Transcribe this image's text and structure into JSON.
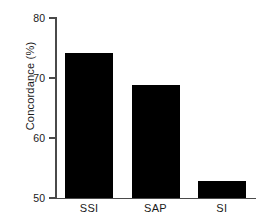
{
  "chart_data": {
    "type": "bar",
    "title": "",
    "xlabel": "",
    "ylabel": "Concordance (%)",
    "categories": [
      "SSI",
      "SAP",
      "SI"
    ],
    "values": [
      74.1,
      68.8,
      52.8
    ],
    "ylim": [
      50,
      80
    ],
    "yticks": [
      50,
      60,
      70,
      80
    ],
    "ytick_labels": [
      "50",
      "60",
      "70",
      "80"
    ],
    "grid": false,
    "legend": null,
    "bar_color": "#000000",
    "background_color": "#ffffff",
    "axis_color": "#4a4a4a"
  },
  "axis": {
    "y_tick_0": "50",
    "y_tick_1": "60",
    "y_tick_2": "70",
    "y_tick_3": "80"
  },
  "categories": {
    "c0": "SSI",
    "c1": "SAP",
    "c2": "SI"
  }
}
